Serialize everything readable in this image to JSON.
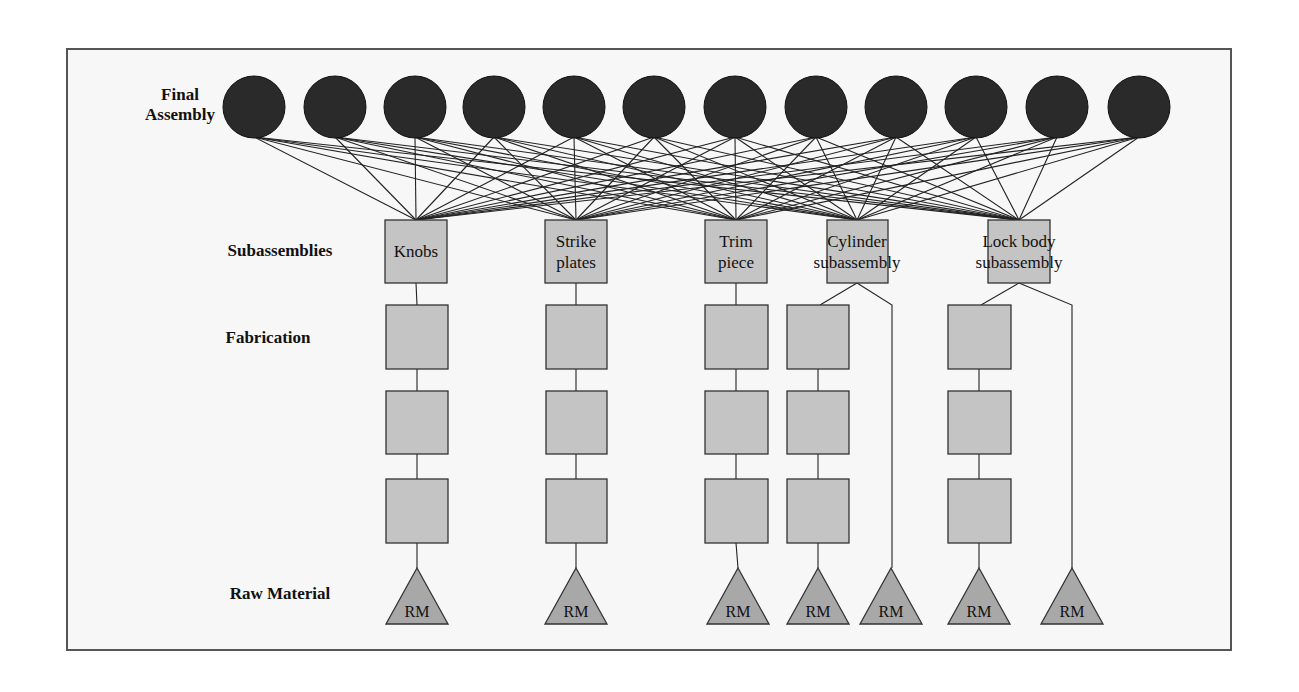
{
  "diagram": {
    "levels": [
      {
        "name": "final_assembly",
        "label_line1": "Final",
        "label_line2": "Assembly"
      },
      {
        "name": "subassemblies",
        "label": "Subassemblies"
      },
      {
        "name": "fabrication",
        "label": "Fabrication"
      },
      {
        "name": "raw_material",
        "label": "Raw Material"
      }
    ],
    "final_assembly_count": 12,
    "subassemblies": [
      {
        "id": "knobs",
        "line1": "Knobs",
        "line2": ""
      },
      {
        "id": "strike-plates",
        "line1": "Strike",
        "line2": "plates"
      },
      {
        "id": "trim-piece",
        "line1": "Trim",
        "line2": "piece"
      },
      {
        "id": "cylinder-subassembly",
        "line1": "Cylinder",
        "line2": "subassembly"
      },
      {
        "id": "lock-body-subassembly",
        "line1": "Lock body",
        "line2": "subassembly"
      }
    ],
    "raw_material_label": "RM",
    "raw_material_count": 7,
    "colors": {
      "final_assembly_fill": "#2a2a2a",
      "box_fill": "#c4c4c4",
      "stroke": "#333333",
      "background": "#f7f7f7"
    }
  }
}
